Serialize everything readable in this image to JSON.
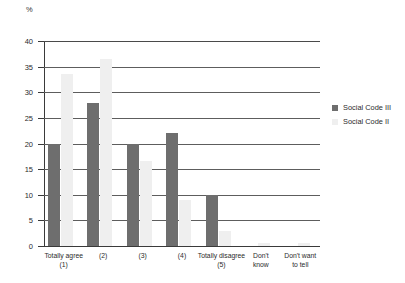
{
  "chart_data": {
    "type": "bar",
    "title": "",
    "xlabel": "",
    "ylabel": "%",
    "unit_label": "%",
    "ylim": [
      0,
      40
    ],
    "ytick_step": 5,
    "yticks": [
      0,
      5,
      10,
      15,
      20,
      25,
      30,
      35,
      40
    ],
    "ytick_labels": [
      "0",
      "5",
      "10",
      "15",
      "20",
      "25",
      "30",
      "35",
      "40"
    ],
    "grid": true,
    "legend_position": "right",
    "categories": [
      "Totally agree\n(1)",
      "(2)",
      "(3)",
      "(4)",
      "Totally disagree\n(5)",
      "Don't\nknow",
      "Don't want\nto tell"
    ],
    "category_lines": [
      [
        "Totally agree",
        "(1)"
      ],
      [
        "(2)",
        ""
      ],
      [
        "(3)",
        ""
      ],
      [
        "(4)",
        ""
      ],
      [
        "Totally disagree",
        "(5)"
      ],
      [
        "Don't",
        "know"
      ],
      [
        "Don't want",
        "to tell"
      ]
    ],
    "series": [
      {
        "name": "Social Code III",
        "color": "#6e6e6e",
        "values": [
          20,
          28,
          20,
          22,
          10,
          0,
          0
        ]
      },
      {
        "name": "Social Code II",
        "color": "#efefef",
        "values": [
          33.5,
          36.5,
          16.5,
          9,
          3,
          0.5,
          0.5
        ]
      }
    ]
  },
  "legend": {
    "items": [
      {
        "label": "Social Code III",
        "color": "#6e6e6e"
      },
      {
        "label": "Social Code II",
        "color": "#efefef"
      }
    ]
  }
}
